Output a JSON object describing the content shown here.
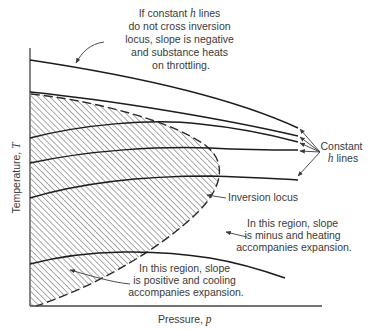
{
  "figure": {
    "axes": {
      "x_label": "Pressure,",
      "x_symbol": "p",
      "y_label": "Temperature,",
      "y_symbol": "T"
    },
    "annotations": {
      "top_note": {
        "lines": [
          "If constant",
          "h",
          "lines",
          "do not cross inversion",
          "locus, slope is negative",
          "and substance heats",
          "on throttling."
        ]
      },
      "constant_h": {
        "line1": "Constant",
        "symbol": "h",
        "line2_suffix": "lines"
      },
      "inversion_locus": "Inversion locus",
      "heating_region": {
        "lines": [
          "In this region, slope",
          "is minus and heating",
          "accompanies expansion."
        ]
      },
      "cooling_region": {
        "lines": [
          "In this region, slope",
          "is positive and cooling",
          "accompanies expansion."
        ]
      }
    },
    "curves": [
      {
        "name": "constant-h-line-1",
        "description": "highest, does not cross inversion locus, slope negative"
      },
      {
        "name": "constant-h-line-2",
        "description": "starts at locus boundary, slope negative"
      },
      {
        "name": "constant-h-line-3",
        "description": "rises to maximum inside locus then falls"
      },
      {
        "name": "constant-h-line-4",
        "description": "rises through locus then levels"
      },
      {
        "name": "constant-h-line-5",
        "description": "rises through locus then levels"
      },
      {
        "name": "constant-h-line-6",
        "description": "lowest, rises then falls"
      }
    ],
    "regions": {
      "hatched": "inside inversion locus, cooling on expansion",
      "clear": "outside inversion locus, heating on expansion"
    }
  }
}
